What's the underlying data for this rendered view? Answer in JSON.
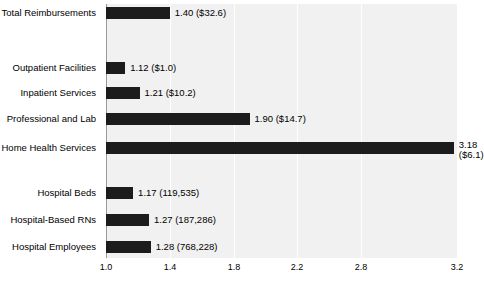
{
  "chart_data": {
    "type": "bar",
    "orientation": "horizontal",
    "title": "",
    "xlabel": "",
    "ylabel": "",
    "xlim": [
      1.0,
      3.2
    ],
    "grid": true,
    "legend": null,
    "tick_labels": [
      "1.0",
      "1.4",
      "1.8",
      "2.2",
      "2.8",
      "3.2"
    ],
    "tick_positions": [
      1.0,
      1.4,
      1.8,
      2.2,
      2.6,
      3.2
    ],
    "categories": [
      "Total Reimbursements",
      "Outpatient Facilities",
      "Inpatient Services",
      "Professional and Lab",
      "Home Health Services",
      "Hospital Beds",
      "Hospital-Based RNs",
      "Hospital Employees"
    ],
    "values": [
      1.4,
      1.12,
      1.21,
      1.9,
      3.18,
      1.17,
      1.27,
      1.28
    ],
    "data_labels": [
      "1.40 ($32.6)",
      "1.12 ($1.0)",
      "1.21 ($10.2)",
      "1.90 ($14.7)",
      "3.18 ($6.1)",
      "1.17 (119,535)",
      "1.27 (187,286)",
      "1.28 (768,228)"
    ],
    "series": [
      {
        "name": "ratio",
        "values": [
          1.4,
          1.12,
          1.21,
          1.9,
          3.18,
          1.17,
          1.27,
          1.28
        ]
      }
    ],
    "bars": [
      {
        "label": "Total Reimbursements",
        "value": 1.4,
        "data_label": "1.40 ($32.6)",
        "data_label_2": "",
        "y": 6,
        "two_line": false
      },
      {
        "label": "Outpatient Facilities",
        "value": 1.12,
        "data_label": "1.12 ($1.0)",
        "data_label_2": "",
        "y": 61,
        "two_line": false
      },
      {
        "label": "Inpatient Services",
        "value": 1.21,
        "data_label": "1.21 ($10.2)",
        "data_label_2": "",
        "y": 86,
        "two_line": false
      },
      {
        "label": "Professional and Lab",
        "value": 1.9,
        "data_label": "1.90 ($14.7)",
        "data_label_2": "",
        "y": 112,
        "two_line": false
      },
      {
        "label": "Home Health Services",
        "value": 3.18,
        "data_label": "3.18",
        "data_label_2": "($6.1)",
        "y": 141,
        "two_line": true
      },
      {
        "label": "Hospital Beds",
        "value": 1.17,
        "data_label": "1.17 (119,535)",
        "data_label_2": "",
        "y": 186,
        "two_line": false
      },
      {
        "label": "Hospital-Based RNs",
        "value": 1.27,
        "data_label": "1.27 (187,286)",
        "data_label_2": "",
        "y": 213,
        "two_line": false
      },
      {
        "label": "Hospital Employees",
        "value": 1.28,
        "data_label": "1.28 (768,228)",
        "data_label_2": "",
        "y": 240,
        "two_line": false
      }
    ],
    "colors": {
      "bar": "#1c1c1c",
      "plot_background": "#f1f1f1",
      "page_background": "#ffffff",
      "gridline": "#ffffff",
      "axis": "#9a9a9a",
      "text": "#000000"
    }
  }
}
